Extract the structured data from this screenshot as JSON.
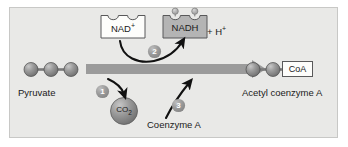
{
  "figure": {
    "panel_background": "#e9e9e7",
    "panel_border": "#c8c8c6"
  },
  "colors": {
    "sphere_fill": "#8e8e8e",
    "sphere_highlight": "#c2c2c2",
    "sphere_edge": "#4a4a4a",
    "main_arrow": "#9b9b9b",
    "curved_arrow": "#111111",
    "badge_fill": "#9a9a9a",
    "badge_text": "#ffffff",
    "nad_box_fill": "#fdfdfb",
    "nadh_box_fill": "#b4b4b4",
    "box_stroke": "#59595a",
    "co2_fill": "#8e8e8e",
    "text": "#1a1a1a"
  },
  "molecules": {
    "pyruvate": {
      "label": "Pyruvate",
      "carbon_count": 3
    },
    "acetyl_coa": {
      "label": "Acetyl coenzyme A",
      "carbon_count": 2,
      "group_label": "CoA"
    },
    "nad_plus": {
      "label": "NAD",
      "charge": "+"
    },
    "nadh": {
      "label": "NADH",
      "hydrogen_dots": 2
    },
    "proton": {
      "plus_sign": "+ H",
      "charge": "+"
    },
    "co2": {
      "label": "CO",
      "subscript": "2"
    },
    "coenzyme_a": {
      "label": "Coenzyme A"
    }
  },
  "steps": [
    {
      "number": "1",
      "name": "decarboxylation-release-co2"
    },
    {
      "number": "2",
      "name": "oxidation-nad-to-nadh"
    },
    {
      "number": "3",
      "name": "coenzyme-a-attachment"
    }
  ]
}
